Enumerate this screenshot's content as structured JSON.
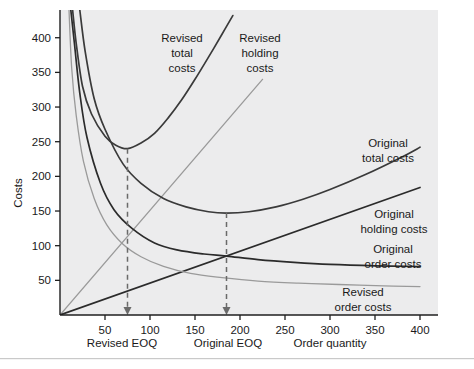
{
  "chart_data": {
    "type": "line",
    "title": "",
    "xlabel": "Order quantity",
    "ylabel": "Costs",
    "xlim": [
      0,
      420
    ],
    "ylim": [
      0,
      440
    ],
    "grid": false,
    "legend_position": "inline-annotations",
    "x_ticks": [
      50,
      100,
      150,
      200,
      250,
      300,
      350,
      400
    ],
    "x_tick_labels": [
      "50",
      "100",
      "150",
      "200",
      "250",
      "300",
      "350",
      "400"
    ],
    "y_ticks": [
      50,
      100,
      150,
      200,
      250,
      300,
      350,
      400
    ],
    "y_tick_labels": [
      "50",
      "100",
      "150",
      "200",
      "250",
      "300",
      "350",
      "400"
    ],
    "series": [
      {
        "name": "Revised total costs",
        "color": "#3a3a3a",
        "style": "curve",
        "label": "Revised\ntotal\ncosts",
        "minimum": {
          "x": 75,
          "y": 240
        },
        "points": [
          {
            "x": 14,
            "y": 440
          },
          {
            "x": 18,
            "y": 392
          },
          {
            "x": 25,
            "y": 330
          },
          {
            "x": 35,
            "y": 290
          },
          {
            "x": 50,
            "y": 258
          },
          {
            "x": 62,
            "y": 245
          },
          {
            "x": 75,
            "y": 240
          },
          {
            "x": 90,
            "y": 248
          },
          {
            "x": 105,
            "y": 262
          },
          {
            "x": 120,
            "y": 284
          },
          {
            "x": 135,
            "y": 310
          },
          {
            "x": 150,
            "y": 340
          },
          {
            "x": 165,
            "y": 372
          },
          {
            "x": 180,
            "y": 405
          },
          {
            "x": 192,
            "y": 432
          }
        ]
      },
      {
        "name": "Revised holding costs",
        "color": "#9a9a9a",
        "style": "line",
        "label": "Revised\nholding\ncosts",
        "slope_per_unit": 1.5,
        "points": [
          {
            "x": 0,
            "y": 0
          },
          {
            "x": 225,
            "y": 340
          }
        ]
      },
      {
        "name": "Original total costs",
        "color": "#3a3a3a",
        "style": "curve",
        "label": "Original\ntotal costs",
        "minimum": {
          "x": 185,
          "y": 147
        },
        "points": [
          {
            "x": 22,
            "y": 440
          },
          {
            "x": 28,
            "y": 380
          },
          {
            "x": 38,
            "y": 312
          },
          {
            "x": 50,
            "y": 268
          },
          {
            "x": 70,
            "y": 218
          },
          {
            "x": 90,
            "y": 190
          },
          {
            "x": 115,
            "y": 168
          },
          {
            "x": 140,
            "y": 156
          },
          {
            "x": 165,
            "y": 149
          },
          {
            "x": 185,
            "y": 147
          },
          {
            "x": 210,
            "y": 149
          },
          {
            "x": 240,
            "y": 156
          },
          {
            "x": 270,
            "y": 167
          },
          {
            "x": 300,
            "y": 181
          },
          {
            "x": 340,
            "y": 203
          },
          {
            "x": 380,
            "y": 228
          },
          {
            "x": 400,
            "y": 242
          }
        ]
      },
      {
        "name": "Original holding costs",
        "color": "#2b2b2b",
        "style": "line",
        "label": "Original\nholding costs",
        "slope_per_unit": 0.46,
        "points": [
          {
            "x": 0,
            "y": 0
          },
          {
            "x": 400,
            "y": 184
          }
        ]
      },
      {
        "name": "Original order costs",
        "color": "#2b2b2b",
        "style": "curve",
        "label": "Original\norder costs",
        "points": [
          {
            "x": 12,
            "y": 440
          },
          {
            "x": 16,
            "y": 392
          },
          {
            "x": 22,
            "y": 320
          },
          {
            "x": 30,
            "y": 256
          },
          {
            "x": 45,
            "y": 190
          },
          {
            "x": 60,
            "y": 152
          },
          {
            "x": 80,
            "y": 125
          },
          {
            "x": 105,
            "y": 104
          },
          {
            "x": 130,
            "y": 94
          },
          {
            "x": 160,
            "y": 88
          },
          {
            "x": 185,
            "y": 85
          },
          {
            "x": 220,
            "y": 80
          },
          {
            "x": 260,
            "y": 76
          },
          {
            "x": 300,
            "y": 73
          },
          {
            "x": 350,
            "y": 71
          },
          {
            "x": 400,
            "y": 70
          }
        ]
      },
      {
        "name": "Revised order costs",
        "color": "#9a9a9a",
        "style": "curve",
        "label": "Revised\norder costs",
        "points": [
          {
            "x": 10,
            "y": 440
          },
          {
            "x": 13,
            "y": 356
          },
          {
            "x": 18,
            "y": 288
          },
          {
            "x": 26,
            "y": 222
          },
          {
            "x": 38,
            "y": 168
          },
          {
            "x": 52,
            "y": 130
          },
          {
            "x": 70,
            "y": 102
          },
          {
            "x": 90,
            "y": 84
          },
          {
            "x": 115,
            "y": 70
          },
          {
            "x": 145,
            "y": 60
          },
          {
            "x": 180,
            "y": 54
          },
          {
            "x": 220,
            "y": 49
          },
          {
            "x": 265,
            "y": 46
          },
          {
            "x": 310,
            "y": 44
          },
          {
            "x": 360,
            "y": 42
          },
          {
            "x": 400,
            "y": 41
          }
        ]
      }
    ],
    "annotations": [
      {
        "name": "revised-eoq",
        "label": "Revised EOQ",
        "x": 75,
        "from_y": 240,
        "to_y": 0
      },
      {
        "name": "original-eoq",
        "label": "Original EOQ",
        "x": 185,
        "from_y": 147,
        "to_y": 0
      }
    ]
  },
  "labels": {
    "revised_total_costs": [
      "Revised",
      "total",
      "costs"
    ],
    "revised_holding_costs": [
      "Revised",
      "holding",
      "costs"
    ],
    "original_total_costs": [
      "Original",
      "total costs"
    ],
    "original_holding_costs": [
      "Original",
      "holding costs"
    ],
    "original_order_costs": [
      "Original",
      "order costs"
    ],
    "revised_order_costs": [
      "Revised",
      "order costs"
    ],
    "revised_eoq": "Revised EOQ",
    "original_eoq": "Original EOQ",
    "order_quantity": "Order quantity",
    "costs": "Costs"
  },
  "colors": {
    "plot_background": "#ececed",
    "dark_line": "#2b2b2b",
    "mid_line": "#3a3a3a",
    "light_line": "#9a9a9a",
    "axis": "#1f1f1f",
    "text": "#1a1a1a",
    "footer_rule": "#c9c9c9",
    "page_background": "#ffffff"
  }
}
